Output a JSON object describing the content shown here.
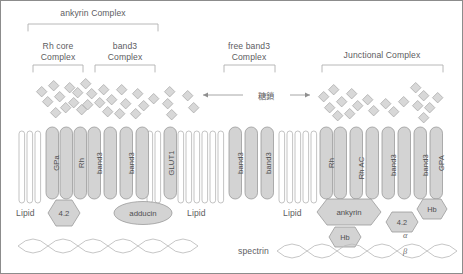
{
  "diagram": {
    "title_groups": [
      {
        "id": "ankyrin-complex",
        "label": "ankyrin Complex",
        "lines": [
          "ankyrin Complex"
        ]
      },
      {
        "id": "rh-core-complex",
        "label": "Rh core Complex",
        "lines": [
          "Rh core",
          "Complex"
        ]
      },
      {
        "id": "band3-complex",
        "label": "band3 Complex",
        "lines": [
          "band3",
          "Complex"
        ]
      },
      {
        "id": "free-band3-complex",
        "label": "free band3 Complex",
        "lines": [
          "free band3",
          "Complex"
        ]
      },
      {
        "id": "junctional-complex",
        "label": "Junctional Complex",
        "lines": [
          "Junctional Complex"
        ]
      }
    ],
    "annotations": {
      "glycan": "糖鎖",
      "spectrin": "spectrin",
      "alpha": "α",
      "beta": "β"
    },
    "lipid_labels": [
      "Lipid",
      "Lipid",
      "Lipid"
    ],
    "membrane_proteins": [
      {
        "id": "gpa",
        "label": "GPa"
      },
      {
        "id": "rh-1",
        "label": "Rh"
      },
      {
        "id": "band3-1",
        "label": "band3"
      },
      {
        "id": "band3-2",
        "label": "band3"
      },
      {
        "id": "glut1",
        "label": "GLUT1"
      },
      {
        "id": "band3-3",
        "label": "band3"
      },
      {
        "id": "band3-4",
        "label": "band3"
      },
      {
        "id": "rh-2",
        "label": "Rh"
      },
      {
        "id": "rh-ac",
        "label": "Rh AC"
      },
      {
        "id": "band3-5",
        "label": "band3"
      },
      {
        "id": "band3-6",
        "label": "band3"
      },
      {
        "id": "gpa-2",
        "label": "GPA"
      }
    ],
    "cytoplasmic_proteins": [
      {
        "id": "protein-4-2-left",
        "label": "4.2",
        "shape": "hexagon"
      },
      {
        "id": "adducin",
        "label": "adducin",
        "shape": "ellipse"
      },
      {
        "id": "ankyrin",
        "label": "ankyrin",
        "shape": "hexagon"
      },
      {
        "id": "hb-lower",
        "label": "Hb",
        "shape": "hexagon"
      },
      {
        "id": "protein-4-2-right",
        "label": "4.2",
        "shape": "hexagon"
      },
      {
        "id": "hb-right",
        "label": "Hb",
        "shape": "hexagon"
      }
    ],
    "colors": {
      "protein_fill": "#d3d3d3",
      "protein_stroke": "#9a9a9a",
      "lipid_fill": "#ffffff",
      "lipid_stroke": "#b4b4b4",
      "glycan_fill": "#d8d8d8",
      "glycan_stroke": "#a8a8a8",
      "bracket": "#b0b0b0",
      "spectrin": "#b9b9b9",
      "text": "#58585a",
      "border": "#8c8c8c"
    }
  }
}
